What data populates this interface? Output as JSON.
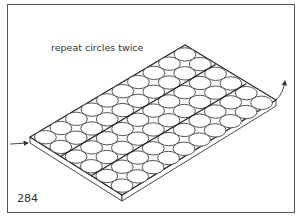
{
  "figure": {
    "caption": "repeat circles twice",
    "number": "284",
    "plate": {
      "corners": {
        "left": [
          30,
          137
        ],
        "top": [
          185,
          45
        ],
        "right": [
          276,
          100
        ],
        "bottom": [
          122,
          195
        ]
      },
      "thickness_px": 6,
      "grid_columns": 10,
      "grid_rows": 6,
      "divider_rows": [
        2,
        4
      ]
    },
    "arrows": {
      "in": {
        "from": [
          10,
          144
        ],
        "to": [
          29,
          143
        ]
      },
      "out": {
        "from": [
          276,
          100
        ],
        "to": [
          286,
          80
        ]
      }
    },
    "colors": {
      "line": "#333333",
      "background": "#ffffff",
      "frame": "#555555"
    }
  }
}
